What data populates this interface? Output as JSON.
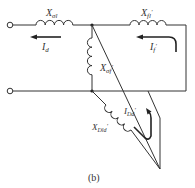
{
  "diagram": {
    "caption": "(b)",
    "labels": {
      "x_sigma_l": "X",
      "x_sigma_l_sub": "σl",
      "x_fl": "X",
      "x_fl_sub": "fl",
      "x_fl_prime": "′",
      "x_sigma_f": "X",
      "x_sigma_f_sub": "σf",
      "x_sigma_f_prime": "′",
      "x_dld": "X",
      "x_dld_sub": "Dld",
      "x_dld_prime": "′",
      "i_d": "I",
      "i_d_sub": "d",
      "i_f": "I",
      "i_f_sub": "f",
      "i_f_prime": "′",
      "i_dd": "I",
      "i_dd_sub": "Dd",
      "i_dd_prime": "′"
    },
    "colors": {
      "line": "#333333",
      "background": "#ffffff"
    }
  }
}
